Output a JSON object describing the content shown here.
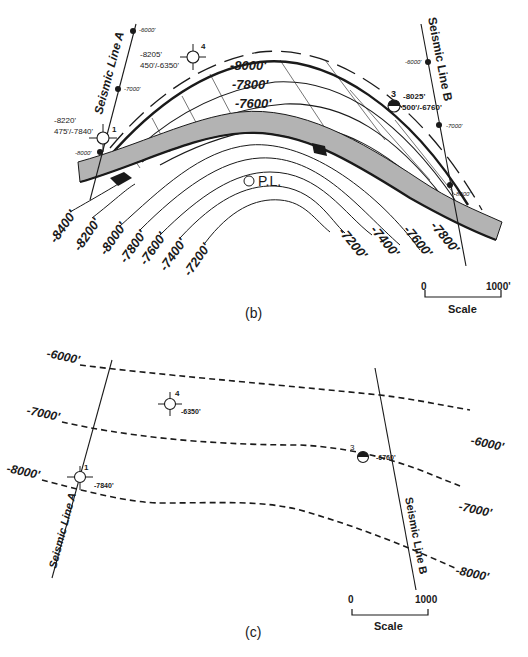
{
  "panel_b": {
    "caption": "(b)",
    "seismic_line_a": {
      "label": "Seismic Line A",
      "shotpoints": [
        "-6000'",
        "-7000'",
        "-8000'"
      ]
    },
    "seismic_line_b": {
      "label": "Seismic Line B",
      "shotpoints": [
        "-6000'",
        "-7000'",
        "-8000'"
      ]
    },
    "wells": [
      {
        "id": "1",
        "line1": "-8220'",
        "line2": "475'/-7840'",
        "symbol": "dry-hole"
      },
      {
        "id": "4",
        "line1": "-8205'",
        "line2": "450'/-6350'",
        "symbol": "dry-hole"
      },
      {
        "id": "3",
        "line1": "-8025'",
        "line2": "500'/-6760'",
        "symbol": "half-filled"
      }
    ],
    "fault_contours_top": [
      "-8000'",
      "-7800'",
      "-7600'"
    ],
    "structure_contours_left": [
      "-8400'",
      "-8200'",
      "-8000'",
      "-7800'",
      "-7600'",
      "-7400'",
      "-7200'"
    ],
    "structure_contours_right": [
      "-7200'",
      "-7400'",
      "-7600'",
      "-7800'"
    ],
    "pl_label": "P.L.",
    "scale": {
      "start": "0",
      "end": "1000'",
      "label": "Scale"
    }
  },
  "panel_c": {
    "caption": "(c)",
    "seismic_line_a": {
      "label": "Seismic Line A"
    },
    "seismic_line_b": {
      "label": "Seismic Line B"
    },
    "contours_left": [
      "-6000'",
      "-7000'",
      "-8000'"
    ],
    "contours_right": [
      "-6000'",
      "-7000'",
      "-8000'"
    ],
    "wells": [
      {
        "id": "4",
        "value": "-6350'",
        "symbol": "dry-hole"
      },
      {
        "id": "3",
        "value": "-6760'",
        "symbol": "half-filled"
      },
      {
        "id": "1",
        "value": "-7840'",
        "symbol": "dry-hole"
      }
    ],
    "scale": {
      "start": "0",
      "end": "1000",
      "label": "Scale"
    }
  },
  "colors": {
    "ink": "#1a1a1a",
    "fault_fill": "#b3b3b3",
    "background": "#ffffff"
  }
}
